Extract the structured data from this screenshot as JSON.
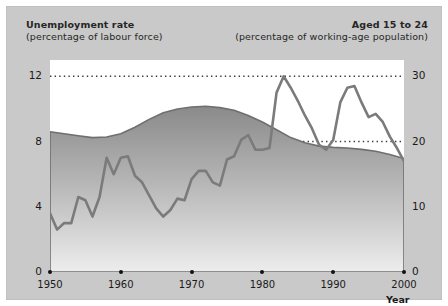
{
  "header": {
    "left_line1": "Unemployment rate",
    "left_line2": "(percentage of labour force)",
    "right_line1": "Aged 15 to 24",
    "right_line2": "(percentage of working-age population)"
  },
  "axes": {
    "left_ticks": [
      "0",
      "4",
      "8",
      "12"
    ],
    "right_ticks": [
      "0",
      "10",
      "20",
      "30"
    ],
    "x_ticks": [
      "1950",
      "1960",
      "1970",
      "1980",
      "1990",
      "2000"
    ],
    "x_title": "Year"
  },
  "colors": {
    "panel_background": "#c9c9c9",
    "plot_background": "#ffffff",
    "line": "#7b7b7b",
    "area_top": "#8a8a8a",
    "area_bottom": "#e8e8e8",
    "text": "#262626",
    "gridline": "#3a3a3a"
  },
  "chart_data": {
    "type": "line",
    "title": "",
    "subtitle": "",
    "xlabel": "Year",
    "ylabel": "Unemployment rate (percentage of labour force)",
    "y2label": "Aged 15 to 24 (percentage of working-age population)",
    "xlim": [
      1950,
      2000
    ],
    "ylim": [
      0,
      13
    ],
    "y2lim": [
      0,
      32.5
    ],
    "yticks": [
      0,
      4,
      8,
      12
    ],
    "y2ticks": [
      0,
      10,
      20,
      30
    ],
    "xticks": [
      1950,
      1960,
      1970,
      1980,
      1990,
      2000
    ],
    "grid": true,
    "grid_style": "dotted-horizontal",
    "legend": "none",
    "series": [
      {
        "name": "Unemployment rate (percentage of labour force)",
        "type": "line",
        "axis": "left",
        "color": "#7b7b7b",
        "x": [
          1950,
          1951,
          1952,
          1953,
          1954,
          1955,
          1956,
          1957,
          1958,
          1959,
          1960,
          1961,
          1962,
          1963,
          1964,
          1965,
          1966,
          1967,
          1968,
          1969,
          1970,
          1971,
          1972,
          1973,
          1974,
          1975,
          1976,
          1977,
          1978,
          1979,
          1980,
          1981,
          1982,
          1983,
          1984,
          1985,
          1986,
          1987,
          1988,
          1989,
          1990,
          1991,
          1992,
          1993,
          1994,
          1995,
          1996,
          1997,
          1998,
          1999,
          2000
        ],
        "y": [
          3.6,
          2.6,
          3.0,
          3.0,
          4.6,
          4.4,
          3.4,
          4.6,
          7.0,
          6.0,
          7.0,
          7.1,
          5.9,
          5.5,
          4.7,
          3.9,
          3.4,
          3.8,
          4.5,
          4.4,
          5.7,
          6.2,
          6.2,
          5.5,
          5.3,
          6.9,
          7.1,
          8.1,
          8.4,
          7.5,
          7.5,
          7.6,
          11.0,
          12.0,
          11.3,
          10.5,
          9.6,
          8.8,
          7.8,
          7.5,
          8.1,
          10.4,
          11.3,
          11.4,
          10.4,
          9.5,
          9.7,
          9.2,
          8.3,
          7.6,
          6.8
        ]
      },
      {
        "name": "Aged 15 to 24 (percentage of working-age population)",
        "type": "area",
        "axis": "right",
        "color_top": "#8a8a8a",
        "color_bottom": "#e8e8e8",
        "x": [
          1950,
          1952,
          1954,
          1956,
          1958,
          1960,
          1962,
          1964,
          1966,
          1968,
          1970,
          1972,
          1974,
          1976,
          1978,
          1980,
          1982,
          1984,
          1986,
          1988,
          1990,
          1992,
          1994,
          1996,
          1998,
          2000
        ],
        "y": [
          21.5,
          21.2,
          20.9,
          20.6,
          20.7,
          21.2,
          22.2,
          23.4,
          24.4,
          25.0,
          25.3,
          25.4,
          25.2,
          24.8,
          24.0,
          23.0,
          21.8,
          20.6,
          19.8,
          19.3,
          19.1,
          19.0,
          18.8,
          18.5,
          18.0,
          17.4
        ]
      }
    ]
  }
}
